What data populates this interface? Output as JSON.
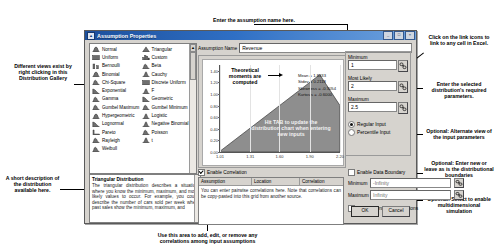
{
  "dialog": {
    "title": "Assumption Properties",
    "titlebar_icon": "assumption-icon",
    "minimize_label": "_",
    "maximize_label": "□",
    "close_label": "×"
  },
  "gallery": {
    "column_left": [
      {
        "label": "Normal",
        "glyph": "bell"
      },
      {
        "label": "Uniform",
        "glyph": "block"
      },
      {
        "label": "Bernoulli",
        "glyph": "twobar"
      },
      {
        "label": "Binomial",
        "glyph": "bell"
      },
      {
        "label": "Chi-Square",
        "glyph": "skew"
      },
      {
        "label": "Exponential",
        "glyph": "decay"
      },
      {
        "label": "Gamma",
        "glyph": "skew"
      },
      {
        "label": "Gumbel Maximum",
        "glyph": "skew"
      },
      {
        "label": "Hypergeometric",
        "glyph": "bell"
      },
      {
        "label": "Lognormal",
        "glyph": "decay"
      },
      {
        "label": "Pareto",
        "glyph": "lshape"
      },
      {
        "label": "Rayleigh",
        "glyph": "skew"
      },
      {
        "label": "Weibull",
        "glyph": "skew"
      }
    ],
    "column_right": [
      {
        "label": "Triangular",
        "glyph": "tri"
      },
      {
        "label": "Custom",
        "glyph": "custom"
      },
      {
        "label": "Beta",
        "glyph": "skew"
      },
      {
        "label": "Cauchy",
        "glyph": "spike"
      },
      {
        "label": "Discrete Uniform",
        "glyph": "block"
      },
      {
        "label": "F",
        "glyph": "spike"
      },
      {
        "label": "Geometric",
        "glyph": "decay"
      },
      {
        "label": "Gumbel Minimum",
        "glyph": "skew"
      },
      {
        "label": "Logistic",
        "glyph": "spike"
      },
      {
        "label": "Negative Binomial",
        "glyph": "spike"
      },
      {
        "label": "Poisson",
        "glyph": "skew"
      },
      {
        "label": "t",
        "glyph": "spike"
      }
    ],
    "scroll_up": "▲",
    "scroll_down": "▼"
  },
  "description": {
    "title": "Triangular Distribution",
    "body": "The triangular distribution describes a situation where you know the minimum, maximum, and most likely values to occur. For example, you could describe the number of cars sold per week when past sales show the minimum, maximum, and"
  },
  "assumption_name": {
    "label": "Assumption Name",
    "value": "Revenue"
  },
  "chart": {
    "stats": [
      "Mean = 1.8333",
      "Stdev = 0.2118",
      "Skewness = -0.3054",
      "Kurtosis = -0.6000"
    ]
  },
  "chart_data": {
    "type": "line",
    "title": "",
    "xlabel": "",
    "ylabel": "",
    "xlim": [
      1.01,
      2.2
    ],
    "ylim": [
      0.0,
      1.5
    ],
    "xticks": [
      "1.01",
      "1.31",
      "1.60",
      "1.90",
      "2.20"
    ],
    "yticks": [
      "1.40",
      "1.20",
      "1.00",
      "0.80",
      "0.60",
      "0.40",
      "0.20",
      "0.00"
    ],
    "grid": true,
    "legend": "none",
    "series": [
      {
        "name": "Triangular PDF",
        "shape": "triangle",
        "min": 1.0,
        "mode": 2.0,
        "max": 2.5,
        "peak_density": 1.333,
        "x": [
          1.01,
          1.31,
          1.6,
          1.9,
          2.0,
          2.2
        ],
        "y": [
          0.013,
          0.413,
          0.8,
          1.2,
          1.333,
          0.667
        ]
      }
    ]
  },
  "parameters": {
    "minimum_label": "Minimum",
    "minimum_value": "1",
    "most_likely_label": "Most Likely",
    "most_likely_value": "2",
    "maximum_label": "Maximum",
    "maximum_value": "2.5",
    "regular_input_label": "Regular Input",
    "percentile_input_label": "Percentile Input",
    "input_mode": "Regular Input",
    "link_icon": "link-icon"
  },
  "correlation": {
    "enable_label": "Enable Correlation",
    "enabled": true,
    "columns": [
      "Assumption",
      "Location",
      "Correlation"
    ],
    "empty_text": "You can enter pairwise correlations here. Note that correlations can be copy-pasted into this grid from another source."
  },
  "boundary": {
    "enable_data_boundary_label": "Enable Data Boundary",
    "data_boundary_enabled": false,
    "minimum_label": "Minimum",
    "minimum_value": "-Infinity",
    "maximum_label": "Maximum",
    "maximum_value": "Infinity",
    "enable_dynamic_simulations_label": "Enable Dynamic Simulations",
    "dynamic_simulations_enabled": false
  },
  "buttons": {
    "ok": "OK",
    "cancel": "Cancel"
  },
  "annotations": {
    "top": "Enter the assumption name here.",
    "left_gallery": "Different views exist by right clicking in this Distribution Gallery",
    "left_description": "A short description of the distribution available here.",
    "chart_note": "Theoretical moments are computed",
    "chart_hint": "Hit TAB to update the distribution chart when entering new inputs",
    "right_link": "Click on the link icons to link to any cell in Excel.",
    "right_params": "Enter the selected distribution's required parameters.",
    "right_alternate": "Optional: Alternate view of the input parameters",
    "right_boundaries": "Optional: Enter new or leave as is the distributional boundaries",
    "right_multidim": "Optional: Select to enable multidimensional simulation",
    "bottom_correlation": "Use this area to add, edit, or remove any correlations among input assumptions"
  }
}
